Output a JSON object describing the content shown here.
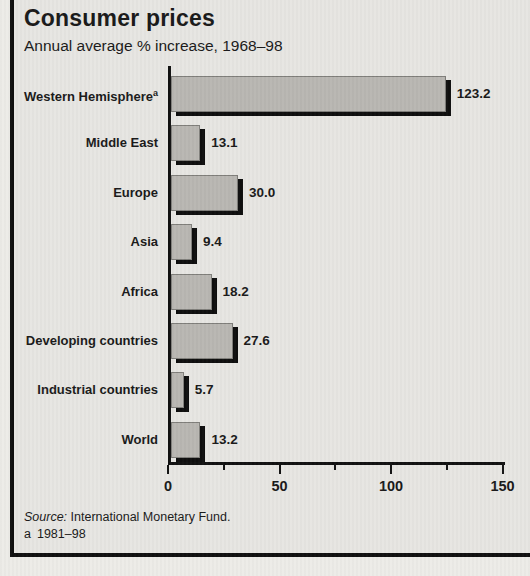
{
  "header": {
    "title": "Consumer prices",
    "subtitle": "Annual average % increase, 1968–98"
  },
  "footer": {
    "source_prefix": "Source:",
    "source_body": " International Monetary Fund.",
    "footnote_marker": "a",
    "footnote_text": "1981–98"
  },
  "colors": {
    "bar_fill": "#b9b7b2",
    "bar_shadow": "#0e0e0e",
    "panel_background": "#e7e6e2",
    "frame": "#101010"
  },
  "chart_data": {
    "type": "bar",
    "orientation": "horizontal",
    "title": "Consumer prices",
    "subtitle": "Annual average % increase, 1968–98",
    "categories": [
      "Western Hemisphere",
      "Middle East",
      "Europe",
      "Asia",
      "Africa",
      "Developing countries",
      "Industrial countries",
      "World"
    ],
    "category_footnotes": [
      "a",
      "",
      "",
      "",
      "",
      "",
      "",
      ""
    ],
    "values": [
      123.2,
      13.1,
      30.0,
      9.4,
      18.2,
      27.6,
      5.7,
      13.2
    ],
    "value_labels": [
      "123.2",
      "13.1",
      "30.0",
      "9.4",
      "18.2",
      "27.6",
      "5.7",
      "13.2"
    ],
    "xlim": [
      0,
      150
    ],
    "x_major_ticks": [
      0,
      50,
      100,
      150
    ],
    "x_minor_ticks": [
      25,
      75,
      125
    ],
    "grid": false,
    "legend": "none",
    "source": "Source: International Monetary Fund.",
    "footnote": "a 1981–98"
  }
}
